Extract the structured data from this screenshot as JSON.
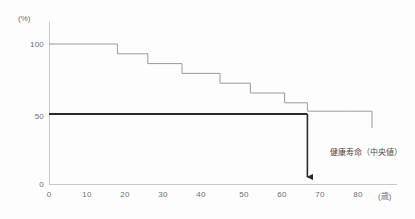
{
  "chart": {
    "type": "step",
    "unit_y": "(%)",
    "unit_x": "(歳)",
    "y_ticks": [
      "0",
      "50",
      "100"
    ],
    "x_ticks": [
      "0",
      "10",
      "20",
      "30",
      "40",
      "50",
      "60",
      "70",
      "80"
    ],
    "annotation": "健康寿命（中央値）",
    "line_color": "#9b9b9b",
    "reference_color": "#2b2b2b",
    "axis_color": "#c9c9c9",
    "text_color": "#6f6f6f"
  },
  "chart_data": {
    "type": "line",
    "title": "",
    "subtitle": "",
    "xlabel": "(歳)",
    "ylabel": "(%)",
    "xlim": [
      0,
      85
    ],
    "ylim": [
      0,
      105
    ],
    "grid": false,
    "legend": "none",
    "series": [
      {
        "name": "健康生存率",
        "step": "post",
        "x": [
          0,
          8,
          18,
          26,
          35,
          45,
          53,
          62,
          68,
          79,
          85
        ],
        "y": [
          100,
          100,
          93,
          86,
          79,
          72,
          65,
          58,
          52,
          52,
          40
        ]
      }
    ],
    "reference_lines": [
      {
        "name": "50%水準",
        "orientation": "horizontal",
        "value": 50,
        "x_from": 0,
        "x_to": 68,
        "bold": true
      }
    ],
    "annotations": [
      {
        "text": "健康寿命（中央値）",
        "x": 68,
        "y": 50,
        "arrow_to_y": 0,
        "arrow": "down"
      }
    ],
    "y_tick_values": [
      0,
      50,
      100
    ],
    "x_tick_values": [
      0,
      10,
      20,
      30,
      40,
      50,
      60,
      70,
      80
    ]
  }
}
